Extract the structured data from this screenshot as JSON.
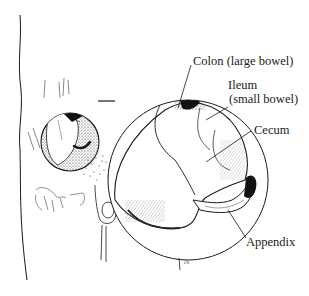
{
  "figure": {
    "style": "black-and-white pen line drawing",
    "colors": {
      "ink": "#1a1a1a",
      "background": "#ffffff"
    }
  },
  "labels": {
    "colon": "Colon (large bowel)",
    "ileum_line1": "Ileum",
    "ileum_line2": "(small bowel)",
    "cecum": "Cecum",
    "appendix": "Appendix"
  },
  "signature": "cs"
}
